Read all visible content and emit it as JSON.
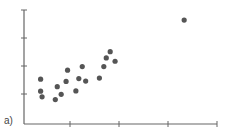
{
  "panel_label": "a)",
  "chart_data": {
    "type": "scatter",
    "title": "",
    "xlabel": "",
    "ylabel": "",
    "x_ticks": [
      1,
      2,
      3,
      4
    ],
    "y_ticks": [
      1,
      2,
      3,
      4
    ],
    "x_tick_labels": [],
    "y_tick_labels": [],
    "xlim": [
      0,
      4
    ],
    "ylim": [
      0,
      4
    ],
    "grid": false,
    "legend": null,
    "marker_color": "#555555",
    "axis_color": "#666666",
    "points": [
      {
        "x": 0.4,
        "y": 1.53
      },
      {
        "x": 0.4,
        "y": 1.1
      },
      {
        "x": 0.43,
        "y": 0.9
      },
      {
        "x": 0.7,
        "y": 0.8
      },
      {
        "x": 0.74,
        "y": 1.26
      },
      {
        "x": 0.82,
        "y": 0.99
      },
      {
        "x": 0.92,
        "y": 1.45
      },
      {
        "x": 0.95,
        "y": 1.85
      },
      {
        "x": 1.12,
        "y": 1.11
      },
      {
        "x": 1.18,
        "y": 1.55
      },
      {
        "x": 1.25,
        "y": 1.98
      },
      {
        "x": 1.32,
        "y": 1.46
      },
      {
        "x": 1.6,
        "y": 1.57
      },
      {
        "x": 1.69,
        "y": 1.98
      },
      {
        "x": 1.74,
        "y": 2.29
      },
      {
        "x": 1.82,
        "y": 2.51
      },
      {
        "x": 1.92,
        "y": 2.17
      },
      {
        "x": 3.33,
        "y": 3.64
      }
    ]
  }
}
